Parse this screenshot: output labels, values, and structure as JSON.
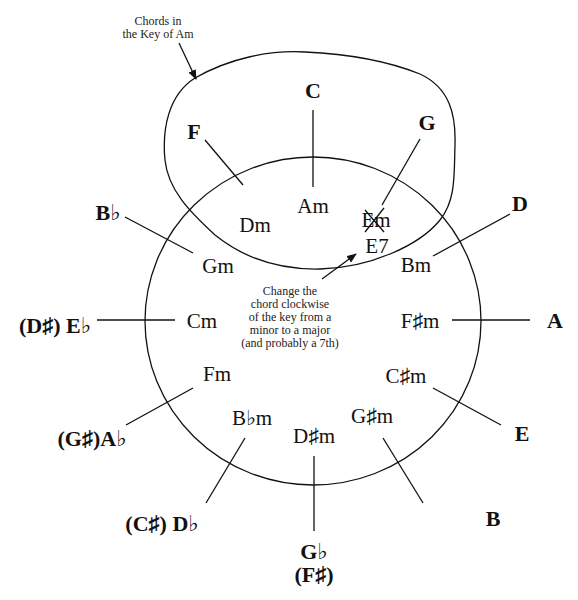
{
  "annotations": {
    "key_label": [
      "Chords in",
      "the Key of Am"
    ],
    "change_note": [
      "Change the",
      "chord clockwise",
      "of the key from a",
      "minor to a major",
      "(and probably a 7th)"
    ]
  },
  "circle_of_fifths": {
    "majors": [
      {
        "name": "C",
        "label": "C"
      },
      {
        "name": "G",
        "label": "G"
      },
      {
        "name": "D",
        "label": "D"
      },
      {
        "name": "A",
        "label": "A"
      },
      {
        "name": "E",
        "label": "E"
      },
      {
        "name": "B",
        "label": "B"
      },
      {
        "name": "Gb",
        "label": "G♭",
        "alt": "(F♯)"
      },
      {
        "name": "Db",
        "label": "(C♯) D♭"
      },
      {
        "name": "Ab",
        "label": "(G♯)A♭"
      },
      {
        "name": "Eb",
        "label": "(D♯) E♭"
      },
      {
        "name": "Bb",
        "label": "B♭"
      },
      {
        "name": "F",
        "label": "F"
      }
    ],
    "minors": [
      {
        "name": "Am",
        "label": "Am"
      },
      {
        "name": "Em",
        "label": "Em",
        "crossed_out": true,
        "replacement": "E7"
      },
      {
        "name": "Bm",
        "label": "Bm"
      },
      {
        "name": "F#m",
        "label": "F♯m"
      },
      {
        "name": "C#m",
        "label": "C♯m"
      },
      {
        "name": "G#m",
        "label": "G♯m"
      },
      {
        "name": "D#m",
        "label": "D♯m"
      },
      {
        "name": "Bbm",
        "label": "B♭m"
      },
      {
        "name": "Fm",
        "label": "Fm"
      },
      {
        "name": "Cm",
        "label": "Cm"
      },
      {
        "name": "Gm",
        "label": "Gm"
      },
      {
        "name": "Dm",
        "label": "Dm"
      }
    ]
  }
}
